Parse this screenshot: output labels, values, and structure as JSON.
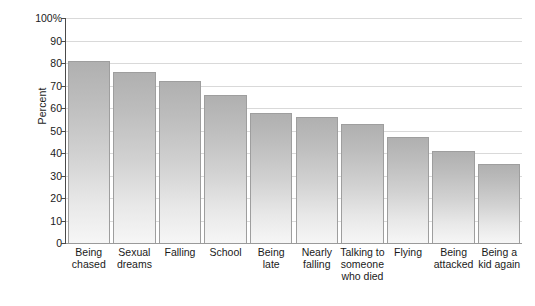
{
  "chart_data": {
    "type": "bar",
    "title": "",
    "xlabel": "",
    "ylabel": "Percent",
    "ylim": [
      0,
      100
    ],
    "grid": true,
    "legend": "none",
    "y_ticks": [
      {
        "value": 0,
        "label": "0"
      },
      {
        "value": 10,
        "label": "10"
      },
      {
        "value": 20,
        "label": "20"
      },
      {
        "value": 30,
        "label": "30"
      },
      {
        "value": 40,
        "label": "40"
      },
      {
        "value": 50,
        "label": "50"
      },
      {
        "value": 60,
        "label": "60"
      },
      {
        "value": 70,
        "label": "70"
      },
      {
        "value": 80,
        "label": "80"
      },
      {
        "value": 90,
        "label": "90"
      },
      {
        "value": 100,
        "label": "100%"
      }
    ],
    "categories": [
      "Being\nchased",
      "Sexual\ndreams",
      "Falling",
      "School",
      "Being\nlate",
      "Nearly\nfalling",
      "Talking to\nsomeone\nwho died",
      "Flying",
      "Being\nattacked",
      "Being a\nkid again"
    ],
    "values": [
      81,
      76,
      72,
      66,
      58,
      56,
      53,
      47,
      41,
      35
    ],
    "bar_color": "#c4c4c4",
    "bar_edge_color": "#9e9e9e",
    "gridline_color": "#d9d9d9",
    "axis_color": "#4a4a4a"
  }
}
